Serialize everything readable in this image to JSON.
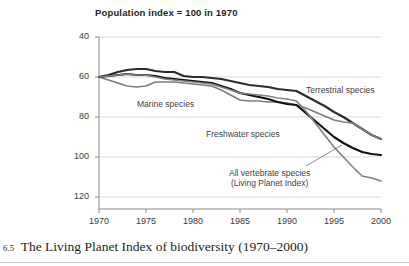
{
  "figure": {
    "background_color": "#ffffff",
    "caption_number": "6.5",
    "caption_text": "The Living Planet Index of biodiversity (1970–2000)"
  },
  "chart_data": {
    "type": "line",
    "title": "Population index = 100 in 1970",
    "xlabel": "",
    "ylabel": "",
    "xlim": [
      1970,
      2000
    ],
    "ylim": [
      40,
      120
    ],
    "xticks": [
      1970,
      1975,
      1980,
      1985,
      1990,
      1995,
      2000
    ],
    "yticks": [
      40,
      60,
      80,
      100,
      120
    ],
    "grid": "horizontal",
    "legend": "inline-annotations",
    "x": [
      1970,
      1971,
      1972,
      1973,
      1974,
      1975,
      1976,
      1977,
      1978,
      1979,
      1980,
      1981,
      1982,
      1983,
      1984,
      1985,
      1986,
      1987,
      1988,
      1989,
      1990,
      1991,
      1992,
      1993,
      1994,
      1995,
      1996,
      1997,
      1998,
      1999,
      2000
    ],
    "series": [
      {
        "name": "Terrestrial species",
        "color": "#2b2b2b",
        "width": 2.1,
        "values": [
          100,
          101,
          102.5,
          103.5,
          104,
          104,
          103,
          102.5,
          102.5,
          100.5,
          100,
          100,
          99.5,
          99,
          98,
          97,
          96,
          95.5,
          95,
          94,
          93.5,
          93,
          90.5,
          88,
          85.5,
          82.5,
          80,
          77,
          74,
          71,
          69
        ],
        "label_position": {
          "x": 306,
          "y": 85
        }
      },
      {
        "name": "Marine species",
        "color": "#7d7d7d",
        "width": 1.7,
        "values": [
          100,
          98.5,
          97,
          95.5,
          95,
          95.5,
          97.5,
          97.5,
          97.5,
          97,
          96.5,
          96,
          95.5,
          93.5,
          91,
          88.5,
          88,
          88,
          87.5,
          87.5,
          87,
          86,
          84.5,
          82.5,
          80.5,
          78.5,
          77.5,
          77,
          74,
          71,
          69
        ],
        "label_position": {
          "x": 137,
          "y": 99
        }
      },
      {
        "name": "Freshwater species",
        "color": "#111111",
        "width": 2.1,
        "values": [
          100,
          100.5,
          101,
          101.5,
          101,
          101,
          100.5,
          99.5,
          99,
          98.5,
          98,
          97.5,
          97,
          95.5,
          94,
          92,
          91,
          90,
          89,
          87.5,
          86.5,
          86,
          82,
          78,
          74,
          70,
          67,
          64.5,
          62.5,
          61.5,
          61
        ],
        "label_position": {
          "x": 206,
          "y": 129
        }
      },
      {
        "name": "All vertebrate species (Living Planet Index)",
        "name_line1": "All vertebrate species",
        "name_line2": "(Living Planet Index)",
        "color": "#828282",
        "width": 1.7,
        "values": [
          100,
          100.5,
          101,
          101.5,
          101,
          101,
          100,
          99,
          98.5,
          98,
          97.5,
          97,
          96.5,
          95,
          93.5,
          92,
          91.5,
          91,
          90.5,
          89.5,
          89,
          88,
          83,
          77,
          71,
          65,
          60,
          55,
          50.5,
          49.5,
          48
        ],
        "label_position": {
          "x": 229,
          "y": 168
        },
        "leader_line": {
          "x1": 306,
          "y1": 166,
          "x2": 342,
          "y2": 145
        }
      }
    ]
  },
  "axes": {
    "y_tick_labels": [
      "120",
      "100",
      "80",
      "60",
      "40"
    ],
    "x_tick_labels": [
      "1970",
      "1975",
      "1980",
      "1985",
      "1990",
      "1995",
      "2000"
    ],
    "axis_color": "#8a8a8a",
    "grid_color": "#d8d8d8"
  }
}
